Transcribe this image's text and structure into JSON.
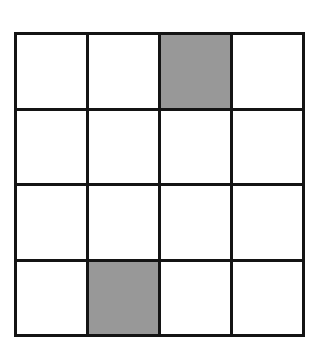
{
  "figure": {
    "type": "grid-diagram",
    "title": "",
    "canvas": {
      "width": 327,
      "height": 354,
      "background_color": "#ffffff"
    },
    "grid": {
      "rows": 4,
      "columns": 4,
      "total_cells": 16,
      "shaded_cells_count": 2,
      "unshaded_cells_count": 14,
      "line_color": "#141414",
      "line_thickness_px": 3,
      "cell_fill_color": "#ffffff",
      "shaded_fill_color": "#989898",
      "bounds": {
        "left": 14,
        "top": 32,
        "right": 305,
        "bottom": 337
      },
      "cells": [
        {
          "id": "r1c1",
          "row": 1,
          "column": 1,
          "shaded": false,
          "label": ""
        },
        {
          "id": "r1c2",
          "row": 1,
          "column": 2,
          "shaded": false,
          "label": ""
        },
        {
          "id": "r1c3",
          "row": 1,
          "column": 3,
          "shaded": true,
          "label": ""
        },
        {
          "id": "r1c4",
          "row": 1,
          "column": 4,
          "shaded": false,
          "label": ""
        },
        {
          "id": "r2c1",
          "row": 2,
          "column": 1,
          "shaded": false,
          "label": ""
        },
        {
          "id": "r2c2",
          "row": 2,
          "column": 2,
          "shaded": false,
          "label": ""
        },
        {
          "id": "r2c3",
          "row": 2,
          "column": 3,
          "shaded": false,
          "label": ""
        },
        {
          "id": "r2c4",
          "row": 2,
          "column": 4,
          "shaded": false,
          "label": ""
        },
        {
          "id": "r3c1",
          "row": 3,
          "column": 1,
          "shaded": false,
          "label": ""
        },
        {
          "id": "r3c2",
          "row": 3,
          "column": 2,
          "shaded": false,
          "label": ""
        },
        {
          "id": "r3c3",
          "row": 3,
          "column": 3,
          "shaded": false,
          "label": ""
        },
        {
          "id": "r3c4",
          "row": 3,
          "column": 4,
          "shaded": false,
          "label": ""
        },
        {
          "id": "r4c1",
          "row": 4,
          "column": 1,
          "shaded": false,
          "label": ""
        },
        {
          "id": "r4c2",
          "row": 4,
          "column": 2,
          "shaded": true,
          "label": ""
        },
        {
          "id": "r4c3",
          "row": 4,
          "column": 3,
          "shaded": false,
          "label": ""
        },
        {
          "id": "r4c4",
          "row": 4,
          "column": 4,
          "shaded": false,
          "label": ""
        }
      ]
    }
  }
}
